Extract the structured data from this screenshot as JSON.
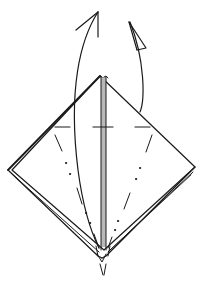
{
  "diagram": {
    "type": "origami-fold-step",
    "colors": {
      "line": "#1a1a1a",
      "paper": "#ffffff",
      "center_strip": "#b8b8b8",
      "background": "#ffffff"
    },
    "shapes": {
      "apex": [
        100,
        76
      ],
      "left_corner": [
        8,
        170
      ],
      "right_corner": [
        195,
        167
      ],
      "bottom_point": [
        102,
        257
      ]
    },
    "arrows": [
      {
        "name": "fold-up-arrow-left",
        "kind": "valley-fold-arrow",
        "direction": "up"
      },
      {
        "name": "fold-behind-arrow-right",
        "kind": "mountain-fold-arrow",
        "direction": "up-behind"
      }
    ],
    "fold_lines": [
      {
        "name": "horizontal-mark-left",
        "style": "dash"
      },
      {
        "name": "horizontal-mark-center",
        "style": "dash"
      },
      {
        "name": "horizontal-mark-right",
        "style": "dash"
      },
      {
        "name": "diagonal-crease-left",
        "style": "dash-dot"
      },
      {
        "name": "diagonal-crease-right",
        "style": "dash-dot"
      }
    ]
  }
}
